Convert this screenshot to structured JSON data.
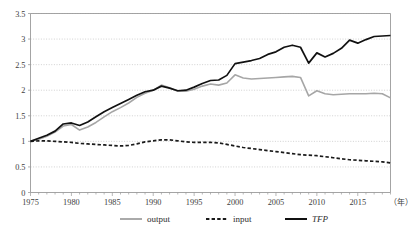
{
  "chart_data": {
    "type": "line",
    "title": "",
    "xlabel": "（年）",
    "ylabel": "",
    "xlim": [
      1975,
      2019
    ],
    "ylim": [
      0,
      3.5
    ],
    "grid": true,
    "legend_position": "bottom",
    "x_ticks": [
      "1975",
      "1980",
      "1985",
      "1990",
      "1995",
      "2000",
      "2005",
      "2010",
      "2015"
    ],
    "x_tick_values": [
      1975,
      1980,
      1985,
      1990,
      1995,
      2000,
      2005,
      2010,
      2015
    ],
    "y_ticks": [
      "0",
      "0.5",
      "1",
      "1.5",
      "2",
      "2.5",
      "3",
      "3.5"
    ],
    "y_tick_values": [
      0,
      0.5,
      1,
      1.5,
      2,
      2.5,
      3,
      3.5
    ],
    "x": [
      1975,
      1976,
      1977,
      1978,
      1979,
      1980,
      1981,
      1982,
      1983,
      1984,
      1985,
      1986,
      1987,
      1988,
      1989,
      1990,
      1991,
      1992,
      1993,
      1994,
      1995,
      1996,
      1997,
      1998,
      1999,
      2000,
      2001,
      2002,
      2003,
      2004,
      2005,
      2006,
      2007,
      2008,
      2009,
      2010,
      2011,
      2012,
      2013,
      2014,
      2015,
      2016,
      2017,
      2018,
      2019
    ],
    "series": [
      {
        "name": "output",
        "color": "#a6a6a6",
        "style": "solid",
        "values": [
          1.0,
          1.04,
          1.1,
          1.18,
          1.3,
          1.33,
          1.22,
          1.28,
          1.37,
          1.48,
          1.58,
          1.66,
          1.75,
          1.86,
          1.94,
          2.0,
          2.1,
          2.05,
          1.98,
          1.98,
          2.02,
          2.08,
          2.12,
          2.1,
          2.14,
          2.3,
          2.24,
          2.22,
          2.23,
          2.24,
          2.25,
          2.26,
          2.27,
          2.25,
          1.89,
          1.99,
          1.93,
          1.91,
          1.92,
          1.93,
          1.93,
          1.93,
          1.94,
          1.93,
          1.85
        ]
      },
      {
        "name": "input",
        "color": "#1a1a1a",
        "style": "dashed",
        "values": [
          1.0,
          1.01,
          1.01,
          1.0,
          0.99,
          0.98,
          0.96,
          0.95,
          0.94,
          0.93,
          0.92,
          0.91,
          0.92,
          0.95,
          0.99,
          1.01,
          1.03,
          1.03,
          1.01,
          0.99,
          0.98,
          0.98,
          0.98,
          0.97,
          0.94,
          0.91,
          0.88,
          0.86,
          0.84,
          0.82,
          0.8,
          0.78,
          0.76,
          0.74,
          0.73,
          0.72,
          0.7,
          0.68,
          0.66,
          0.64,
          0.63,
          0.62,
          0.61,
          0.6,
          0.58
        ]
      },
      {
        "name": "TFP",
        "color": "#111111",
        "style": "solid",
        "values": [
          1.0,
          1.06,
          1.12,
          1.2,
          1.34,
          1.36,
          1.31,
          1.38,
          1.48,
          1.58,
          1.66,
          1.74,
          1.82,
          1.9,
          1.97,
          2.0,
          2.08,
          2.04,
          1.99,
          2.0,
          2.06,
          2.13,
          2.19,
          2.2,
          2.29,
          2.52,
          2.55,
          2.58,
          2.62,
          2.7,
          2.75,
          2.84,
          2.88,
          2.84,
          2.53,
          2.73,
          2.65,
          2.72,
          2.82,
          2.98,
          2.92,
          2.99,
          3.05,
          3.06,
          3.07
        ]
      }
    ]
  },
  "legend": {
    "items": [
      {
        "label": "output",
        "swatch": "gray-solid-line"
      },
      {
        "label": "input",
        "swatch": "black-dashed-line"
      },
      {
        "label": "TFP",
        "swatch": "black-solid-line"
      }
    ]
  },
  "axis": {
    "x_unit_label": "（年）"
  },
  "colors": {
    "output": "#a6a6a6",
    "input": "#1a1a1a",
    "tfp": "#111111",
    "grid": "#bdbdbd",
    "axis": "#9a9a9a",
    "text": "#404040"
  }
}
